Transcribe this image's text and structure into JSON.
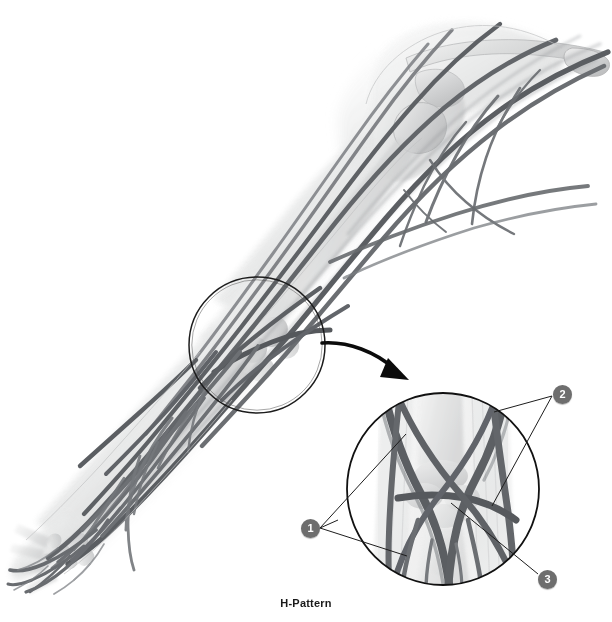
{
  "figure": {
    "caption": "H-Pattern",
    "background_color": "#ffffff",
    "vessel_color": "#6f7276",
    "vessel_dark_color": "#55585c",
    "bone_color": "#d9dadb",
    "skin_color": "#eceded",
    "outline_color": "#111111",
    "badge_fill": "#6e6e6e",
    "badge_text_color": "#ffffff"
  },
  "main_view": {
    "name": "arm-anatomical-illustration",
    "description": "Anterior view of right upper limb from shoulder to hand showing superficial veins over translucent skeleton",
    "regions": [
      "shoulder",
      "upper-arm",
      "elbow",
      "forearm",
      "wrist",
      "hand"
    ],
    "highlight_circle": {
      "label": "antecubital-fossa-highlight",
      "cx": 257,
      "cy": 345,
      "r": 68
    }
  },
  "inset_view": {
    "name": "h-pattern-detail",
    "caption": "H-Pattern",
    "circle": {
      "cx": 443,
      "cy": 489,
      "r": 97
    },
    "callouts": [
      {
        "number": "1",
        "badge_x": 301,
        "badge_y": 519,
        "targets": [
          {
            "x": 406,
            "y": 434
          },
          {
            "x": 407,
            "y": 556
          }
        ]
      },
      {
        "number": "2",
        "badge_x": 553,
        "badge_y": 385,
        "targets": [
          {
            "x": 494,
            "y": 412
          },
          {
            "x": 494,
            "y": 504
          }
        ]
      },
      {
        "number": "3",
        "badge_x": 538,
        "badge_y": 570,
        "targets": [
          {
            "x": 451,
            "y": 503
          }
        ]
      }
    ]
  },
  "arrow": {
    "name": "pointer-arrow",
    "from": {
      "x": 325,
      "y": 343
    },
    "to": {
      "x": 405,
      "y": 378
    }
  }
}
